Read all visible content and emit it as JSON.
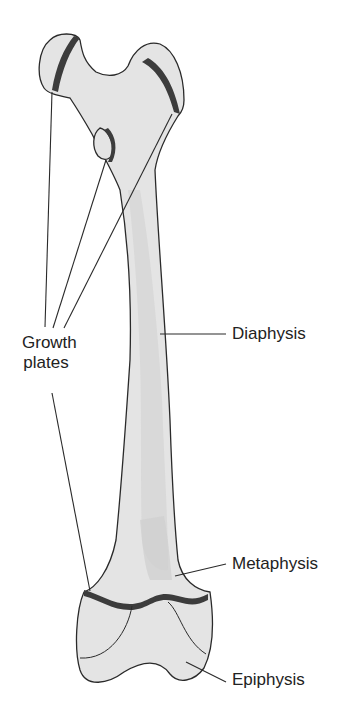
{
  "figure": {
    "colors": {
      "bone_fill": "#e4e4e4",
      "bone_shade": "#cfcfcf",
      "growth_plate": "#3c3c3c",
      "outline": "#2a2a2a",
      "text": "#222222"
    }
  },
  "labels": {
    "growth_plates_line1": "Growth",
    "growth_plates_line2": "plates",
    "diaphysis": "Diaphysis",
    "metaphysis": "Metaphysis",
    "epiphysis": "Epiphysis"
  }
}
